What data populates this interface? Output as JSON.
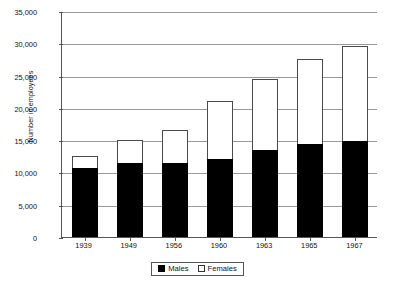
{
  "chart_data": {
    "type": "bar",
    "subtype": "stacked-bar",
    "title": "",
    "xlabel": "",
    "ylabel": "Number in employees",
    "categories": [
      "1939",
      "1949",
      "1956",
      "1960",
      "1963",
      "1965",
      "1967"
    ],
    "series": [
      {
        "name": "Males",
        "color": "#000000",
        "values": [
          10700,
          11400,
          11500,
          12100,
          13500,
          14400,
          14800
        ]
      },
      {
        "name": "Females",
        "color": "#ffffff",
        "values": [
          1800,
          3600,
          5000,
          8900,
          11000,
          13100,
          14800
        ]
      }
    ],
    "totals": [
      12500,
      15000,
      16500,
      21000,
      24500,
      27500,
      29600
    ],
    "ylim": [
      0,
      35000
    ],
    "ytick_values": [
      0,
      5000,
      10000,
      15000,
      20000,
      25000,
      30000,
      35000
    ],
    "ytick_labels": [
      "0",
      "5,000",
      "10,000",
      "15,000",
      "20,000",
      "25,000",
      "30,000",
      "35,000"
    ],
    "grid": true,
    "legend_position": "bottom-center",
    "legend_entries": [
      "Males",
      "Females"
    ]
  },
  "axis": {
    "y_title": "Number in employees"
  },
  "legend": {
    "males_label": "Males",
    "females_label": "Females"
  }
}
